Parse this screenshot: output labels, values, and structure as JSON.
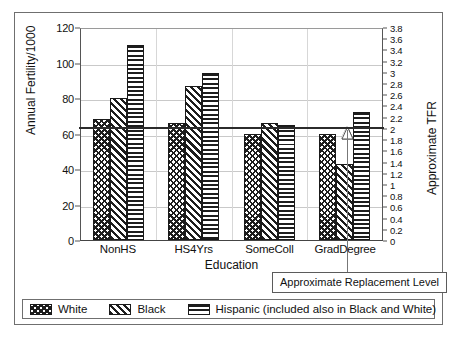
{
  "chart_data": {
    "type": "bar",
    "title": "",
    "xlabel": "Education",
    "ylabel": "Annual Fertility/1000",
    "y2label": "Approximate TFR",
    "categories": [
      "NonHS",
      "HS4Yrs",
      "SomeColl",
      "GradDegree"
    ],
    "series": [
      {
        "name": "White",
        "pattern": "cross-hatch",
        "values": [
          68,
          66,
          60,
          60
        ]
      },
      {
        "name": "Black",
        "pattern": "diagonal-stripe",
        "values": [
          80,
          87,
          66,
          43
        ]
      },
      {
        "name": "Hispanic (included also in Black and White)",
        "pattern": "horizontal-stripe",
        "values": [
          110,
          94,
          65,
          72
        ]
      }
    ],
    "ylim": [
      0,
      120
    ],
    "yticks": [
      0,
      20,
      40,
      60,
      80,
      100,
      120
    ],
    "y2lim": [
      0,
      3.8
    ],
    "y2ticks": [
      "0",
      "0.2",
      "0.4",
      "0.6",
      "0.8",
      "1",
      "1.2",
      "1.4",
      "1.6",
      "1.8",
      "2",
      "2.2",
      "2.4",
      "2.6",
      "2.8",
      "3",
      "3.2",
      "3.4",
      "3.6",
      "3.8"
    ],
    "grid": true,
    "legend_position": "bottom",
    "annotations": [
      {
        "label": "Approximate Replacement Level",
        "value": 65,
        "tfr": 2.0,
        "type": "horizontal-reference-line"
      }
    ]
  },
  "axes": {
    "left_title": "Annual Fertility/1000",
    "right_title": "Approximate TFR",
    "x_title": "Education"
  },
  "legend": {
    "items": [
      {
        "label": "White"
      },
      {
        "label": "Black"
      },
      {
        "label": "Hispanic (included also in Black and White)"
      }
    ]
  },
  "callout": {
    "text": "Approximate Replacement Level"
  }
}
